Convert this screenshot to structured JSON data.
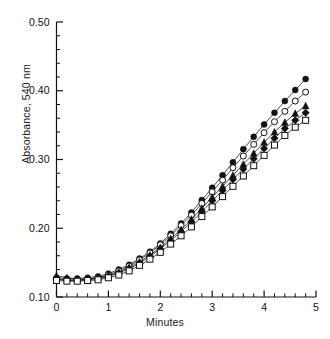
{
  "chart_data": {
    "type": "scatter",
    "title": "",
    "xlabel": "Minutes",
    "ylabel": "Absorbance, 540 nm",
    "xlim": [
      0,
      5
    ],
    "ylim": [
      0.1,
      0.5
    ],
    "xticks": [
      0,
      1,
      2,
      3,
      4,
      5
    ],
    "xticklabels": [
      "0",
      "1",
      "2",
      "3",
      "4",
      "5"
    ],
    "yticks": [
      0.1,
      0.2,
      0.3,
      0.4,
      0.5
    ],
    "yticklabels": [
      "0.10",
      "0.20",
      "0.30",
      "0.40",
      "0.50"
    ],
    "x_minor_interval": 0.2,
    "y_minor_interval": 0.02,
    "grid": false,
    "legend": "none",
    "axis_style": "left-and-bottom-spines-with-inward-ticks",
    "x": [
      0,
      0.2,
      0.4,
      0.6,
      0.8,
      1.0,
      1.2,
      1.4,
      1.6,
      1.8,
      2.0,
      2.2,
      2.4,
      2.6,
      2.8,
      3.0,
      3.2,
      3.4,
      3.6,
      3.8,
      4.0,
      4.2,
      4.4,
      4.6,
      4.8
    ],
    "series": [
      {
        "name": "series-1",
        "marker": "filled-circle",
        "values": [
          0.128,
          0.127,
          0.127,
          0.128,
          0.13,
          0.134,
          0.14,
          0.147,
          0.156,
          0.166,
          0.178,
          0.192,
          0.207,
          0.223,
          0.241,
          0.259,
          0.277,
          0.296,
          0.315,
          0.333,
          0.351,
          0.368,
          0.385,
          0.401,
          0.417
        ]
      },
      {
        "name": "series-2",
        "marker": "open-circle",
        "values": [
          0.126,
          0.125,
          0.125,
          0.126,
          0.128,
          0.132,
          0.138,
          0.145,
          0.154,
          0.164,
          0.176,
          0.189,
          0.204,
          0.219,
          0.236,
          0.253,
          0.27,
          0.288,
          0.305,
          0.322,
          0.339,
          0.355,
          0.37,
          0.385,
          0.398
        ]
      },
      {
        "name": "series-3",
        "marker": "filled-triangle",
        "values": [
          0.131,
          0.128,
          0.126,
          0.126,
          0.128,
          0.131,
          0.136,
          0.143,
          0.151,
          0.161,
          0.172,
          0.185,
          0.198,
          0.213,
          0.229,
          0.245,
          0.261,
          0.277,
          0.293,
          0.309,
          0.325,
          0.34,
          0.354,
          0.367,
          0.378
        ]
      },
      {
        "name": "series-4",
        "marker": "filled-diamond",
        "values": [
          0.126,
          0.124,
          0.124,
          0.125,
          0.127,
          0.13,
          0.135,
          0.141,
          0.149,
          0.159,
          0.17,
          0.182,
          0.195,
          0.209,
          0.224,
          0.24,
          0.255,
          0.271,
          0.286,
          0.301,
          0.316,
          0.331,
          0.345,
          0.357,
          0.368
        ]
      },
      {
        "name": "series-5",
        "marker": "open-square",
        "values": [
          0.124,
          0.123,
          0.123,
          0.124,
          0.125,
          0.128,
          0.132,
          0.138,
          0.146,
          0.155,
          0.165,
          0.177,
          0.189,
          0.202,
          0.217,
          0.231,
          0.246,
          0.261,
          0.276,
          0.291,
          0.306,
          0.321,
          0.335,
          0.347,
          0.357
        ]
      }
    ]
  }
}
